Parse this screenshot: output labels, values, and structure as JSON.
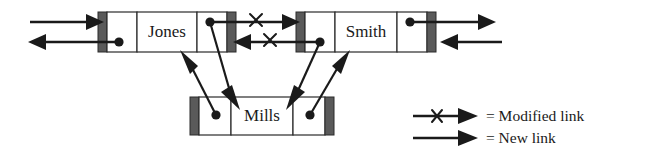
{
  "diagram": {
    "nodes": [
      {
        "id": "jones",
        "label": "Jones"
      },
      {
        "id": "smith",
        "label": "Smith"
      },
      {
        "id": "mills",
        "label": "Mills"
      }
    ],
    "links": [
      {
        "id": "ext-left-in",
        "kind": "existing",
        "from": "external-left",
        "to": "jones",
        "direction": "right"
      },
      {
        "id": "ext-left-out",
        "kind": "existing",
        "from": "jones",
        "to": "external-left",
        "direction": "left"
      },
      {
        "id": "jones-to-smith",
        "kind": "modified",
        "from": "jones",
        "to": "smith",
        "direction": "right"
      },
      {
        "id": "smith-to-jones",
        "kind": "modified",
        "from": "smith",
        "to": "jones",
        "direction": "left"
      },
      {
        "id": "ext-right-out",
        "kind": "existing",
        "from": "smith",
        "to": "external-right",
        "direction": "right"
      },
      {
        "id": "ext-right-in",
        "kind": "existing",
        "from": "external-right",
        "to": "smith",
        "direction": "left"
      },
      {
        "id": "jones-to-mills",
        "kind": "new",
        "from": "jones",
        "to": "mills",
        "direction": "down"
      },
      {
        "id": "mills-to-jones",
        "kind": "new",
        "from": "mills",
        "to": "jones",
        "direction": "up"
      },
      {
        "id": "smith-to-mills",
        "kind": "new",
        "from": "smith",
        "to": "mills",
        "direction": "down"
      },
      {
        "id": "mills-to-smith",
        "kind": "new",
        "from": "mills",
        "to": "smith",
        "direction": "up"
      }
    ],
    "colors": {
      "ink": "#1a1a1a",
      "cell_border": "#2b2b2b",
      "end_cap": "#5a5a5a",
      "background": "#ffffff"
    }
  },
  "legend": {
    "items": [
      {
        "id": "modified",
        "marker": "arrow-with-x",
        "equals": "=",
        "label": "Modified link",
        "text": "= Modified link"
      },
      {
        "id": "new",
        "marker": "arrow-plain",
        "equals": "=",
        "label": "New link",
        "text": "= New link"
      }
    ]
  }
}
